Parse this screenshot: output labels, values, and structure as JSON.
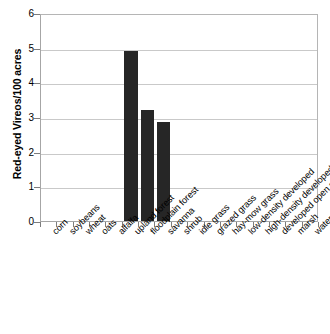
{
  "chart_data": {
    "type": "bar",
    "title": "",
    "subtitle": "",
    "xlabel": "",
    "ylabel": "Red-eyed Vireos/100 acres",
    "ylim": [
      0,
      6
    ],
    "ytick_labels": [
      "6",
      "5",
      "4",
      "3",
      "2",
      "1",
      "0"
    ],
    "ytick_values": [
      6,
      5,
      4,
      3,
      2,
      1,
      0
    ],
    "grid": true,
    "legend": false,
    "legend_position": "none",
    "bar_color": "#262626",
    "gridline_color": "#c9c9c9",
    "axis_color": "#a6a6a6",
    "categories": [
      "corn",
      "soybeans",
      "wheat",
      "oats",
      "alfalfa",
      "upland forest",
      "floodplain forest",
      "savanna",
      "shrub",
      "idle grass",
      "grazed grass",
      "hay-mow grass",
      "low-density developed",
      "high-density developed",
      "developed open space",
      "marsh",
      "water"
    ],
    "values": [
      0,
      0,
      0,
      0,
      0,
      4.9,
      3.2,
      2.85,
      0,
      0,
      0,
      0,
      0,
      0,
      0,
      0,
      0
    ]
  }
}
